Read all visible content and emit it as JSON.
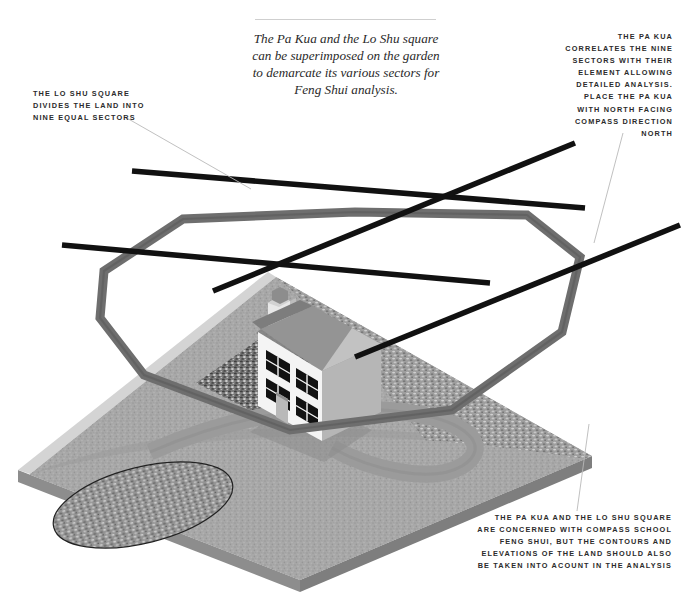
{
  "figure": {
    "caption_lines": [
      "The Pa Kua and the Lo Shu square",
      "can be superimposed on the garden",
      "to demarcate its various sectors for",
      "Feng Shui analysis."
    ]
  },
  "annotations": {
    "lo_shu": {
      "lines": [
        "THE LO SHU SQUARE",
        "DIVIDES THE LAND INTO",
        "NINE EQUAL SECTORS"
      ]
    },
    "pa_kua": {
      "lines": [
        "THE PA KUA",
        "CORRELATES THE NINE",
        "SECTORS WITH THEIR",
        "ELEMENT ALLOWING",
        "DETAILED ANALYSIS.",
        "PLACE THE PA KUA",
        "WITH NORTH FACING",
        "COMPASS DIRECTION",
        "NORTH"
      ]
    },
    "compass_school": {
      "lines": [
        "THE PA KUA AND THE LO SHU SQUARE",
        "ARE CONCERNED WITH COMPASS SCHOOL",
        "FENG SHUI, BUT THE CONTOURS AND",
        "ELEVATIONS OF THE LAND SHOULD ALSO",
        "BE TAKEN INTO ACOUNT IN THE ANALYSIS"
      ]
    }
  },
  "colors": {
    "page_background": "#ffffff",
    "grid_line": "#111111",
    "pakua_band": "#6e6e6e",
    "pakua_band_shadow": "#565656",
    "land_top": "#a6a6a6",
    "land_edge": "#cfcfcf",
    "land_side": "#8a8a8a",
    "path": "#9a9a9a",
    "pond": "#8e8e8e",
    "house_wall": "#f2f2f2",
    "house_gable": "#b4b4b4",
    "house_roof": "#949494",
    "house_roof_dark": "#7d7d7d",
    "window": "#121212",
    "chimney": "#e3e3e3",
    "chimney_cap": "#8d8d8d",
    "leader_line": "#b9b9b9",
    "rule": "#cfcfcf",
    "text": "#2b2b2b"
  },
  "scene": {
    "lo_shu_grid_lines": 4,
    "pa_kua_shape": "octagon",
    "land_shape": "parallelogram-slab",
    "features": [
      "house",
      "chimney",
      "driveway-path",
      "pond",
      "gravel-patch"
    ]
  }
}
